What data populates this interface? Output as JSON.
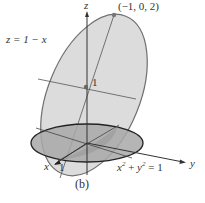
{
  "figure": {
    "caption": "(b)",
    "labels": {
      "z_axis": "z",
      "y_axis": "y",
      "x_axis": "x",
      "plane_eq": "z = 1 − x",
      "point": "(−1, 0, 2)",
      "center_value": "1",
      "x_tick": "1",
      "cylinder_eq_x": "x",
      "cylinder_eq_y": "y",
      "cylinder_eq_rest": " = 1",
      "plus": " + ",
      "sup": "2"
    },
    "colors": {
      "ellipse_fill": "#d9d9d9",
      "disk_fill": "#a9a9a9",
      "outline": "#6f6f6f",
      "disk_outline": "#222222",
      "axis": "#333333",
      "point": "#777777"
    }
  }
}
